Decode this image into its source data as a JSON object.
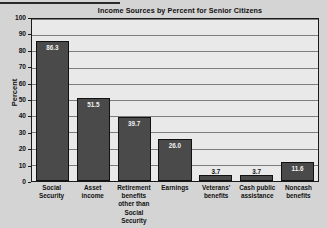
{
  "chart_data": {
    "type": "bar",
    "title": "Income Sources by Percent for Senior Citizens",
    "xlabel": "",
    "ylabel": "Percent",
    "ylim": [
      0,
      100
    ],
    "ytick_step": 10,
    "grid": true,
    "legend": "none",
    "bar_color": "#4a4a4a",
    "plot_background": "#e9e9e9",
    "page_background": "#d4d4d4",
    "categories": [
      "Social Security",
      "Asset income",
      "Retirement benefits other than Social Security",
      "Earnings",
      "Veterans' benefits",
      "Cash public assistance",
      "Noncash benefits"
    ],
    "values": [
      86.3,
      51.5,
      39.7,
      26.0,
      3.7,
      3.7,
      11.6
    ],
    "yticks": [
      "0",
      "10",
      "20",
      "30",
      "40",
      "50",
      "60",
      "70",
      "80",
      "90",
      "100"
    ]
  },
  "bars": [
    {
      "category_lines": [
        "Social",
        "Security"
      ],
      "value": 86.3,
      "value_label": "86.3",
      "label_position": "inside"
    },
    {
      "category_lines": [
        "Asset",
        "income"
      ],
      "value": 51.5,
      "value_label": "51.5",
      "label_position": "inside"
    },
    {
      "category_lines": [
        "Retirement",
        "benefits",
        "other than",
        "Social Security"
      ],
      "value": 39.7,
      "value_label": "39.7",
      "label_position": "inside"
    },
    {
      "category_lines": [
        "Earnings"
      ],
      "value": 26.0,
      "value_label": "26.0",
      "label_position": "inside"
    },
    {
      "category_lines": [
        "Veterans'",
        "benefits"
      ],
      "value": 3.7,
      "value_label": "3.7",
      "label_position": "outside"
    },
    {
      "category_lines": [
        "Cash public",
        "assistance"
      ],
      "value": 3.7,
      "value_label": "3.7",
      "label_position": "outside"
    },
    {
      "category_lines": [
        "Noncash",
        "benefits"
      ],
      "value": 11.6,
      "value_label": "11.6",
      "label_position": "inside"
    }
  ]
}
